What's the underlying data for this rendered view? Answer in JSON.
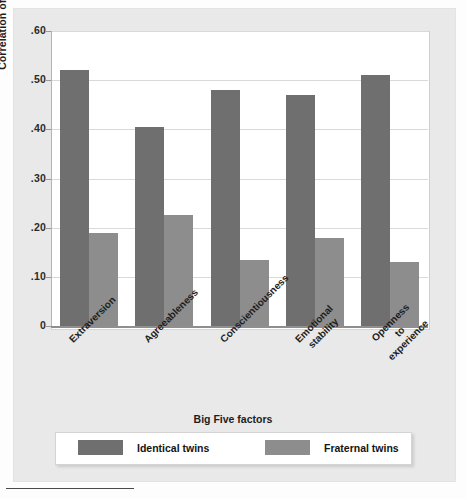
{
  "chart_data": {
    "type": "bar",
    "title": "",
    "xlabel": "Big Five factors",
    "ylabel": "Correlation of scores",
    "ylim": [
      0,
      0.6
    ],
    "grid": true,
    "legend_position": "bottom",
    "categories": [
      "Extraversion",
      "Agreeableness",
      "Conscientiousness",
      "Emotional\nstability",
      "Openness\nto\nexperience"
    ],
    "category_lines": [
      [
        "Extraversion"
      ],
      [
        "Agreeableness"
      ],
      [
        "Conscientiousness"
      ],
      [
        "Emotional",
        "stability"
      ],
      [
        "Openness",
        "to",
        "experience"
      ]
    ],
    "ytick_labels": [
      ".60",
      ".50",
      ".40",
      ".30",
      ".20",
      ".10",
      "0"
    ],
    "ytick_values": [
      0.6,
      0.5,
      0.4,
      0.3,
      0.2,
      0.1,
      0
    ],
    "series": [
      {
        "name": "Identical twins",
        "color": "#6f6f6f",
        "values": [
          0.52,
          0.405,
          0.48,
          0.47,
          0.51
        ]
      },
      {
        "name": "Fraternal twins",
        "color": "#8d8d8d",
        "values": [
          0.19,
          0.225,
          0.135,
          0.18,
          0.13
        ]
      }
    ]
  },
  "axes": {
    "y_title": "Correlation of scores",
    "x_title": "Big Five factors"
  },
  "legend": {
    "items": [
      {
        "label": "Identical twins",
        "color": "#6f6f6f"
      },
      {
        "label": "Fraternal twins",
        "color": "#8d8d8d"
      }
    ]
  },
  "ticks": {
    "y": [
      {
        "label": ".60"
      },
      {
        "label": ".50"
      },
      {
        "label": ".40"
      },
      {
        "label": ".30"
      },
      {
        "label": ".20"
      },
      {
        "label": ".10"
      },
      {
        "label": "0"
      }
    ]
  },
  "colors": {
    "identical": "#6f6f6f",
    "fraternal": "#8d8d8d",
    "panel": "#e9e9e9",
    "plot_background": "#ffffff",
    "gridline": "#d9d9d9",
    "axis": "#8f8f8f"
  }
}
